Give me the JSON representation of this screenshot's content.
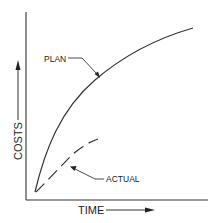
{
  "diagram": {
    "type": "cost-vs-time curve",
    "axes": {
      "x_label": "TIME",
      "y_label": "COSTS"
    },
    "curves": [
      {
        "name": "plan",
        "label": "PLAN",
        "style": "solid"
      },
      {
        "name": "actual",
        "label": "ACTUAL",
        "style": "dashed"
      }
    ],
    "colors": {
      "ink": "#222222",
      "background": "#ffffff"
    }
  }
}
